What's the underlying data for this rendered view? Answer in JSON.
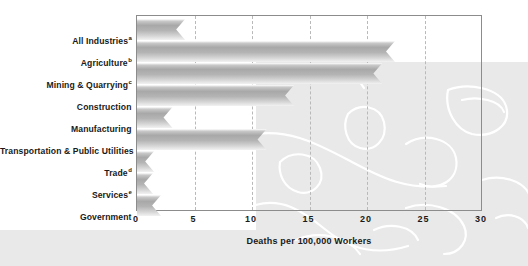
{
  "chart_data": {
    "type": "bar",
    "orientation": "horizontal",
    "title": "",
    "xlabel": "Deaths per 100,000 Workers",
    "ylabel": "",
    "xlim": [
      0,
      30
    ],
    "xticks": [
      "0",
      "5",
      "10",
      "15",
      "20",
      "25",
      "30"
    ],
    "xtick_values": [
      0,
      5,
      10,
      15,
      20,
      25,
      30
    ],
    "grid": "vertical-dashed",
    "legend": "none",
    "categories": [
      "All Industries",
      "Agriculture",
      "Mining & Quarrying",
      "Construction",
      "Manufacturing",
      "Transportation & Public Utilities",
      "Trade",
      "Services",
      "Government"
    ],
    "category_footnotes": [
      "a",
      "b",
      "c",
      "",
      "",
      "",
      "d",
      "e",
      ""
    ],
    "values": [
      4.2,
      22.5,
      21.4,
      13.7,
      3.1,
      11.3,
      1.5,
      1.4,
      2.1
    ],
    "bars": [
      {
        "label": "All Industries",
        "footnote": "a",
        "value": 4.2
      },
      {
        "label": "Agriculture",
        "footnote": "b",
        "value": 22.5
      },
      {
        "label": "Mining & Quarrying",
        "footnote": "c",
        "value": 21.4
      },
      {
        "label": "Construction",
        "footnote": "",
        "value": 13.7
      },
      {
        "label": "Manufacturing",
        "footnote": "",
        "value": 3.1
      },
      {
        "label": "Transportation & Public Utilities",
        "footnote": "",
        "value": 11.3
      },
      {
        "label": "Trade",
        "footnote": "d",
        "value": 1.5
      },
      {
        "label": "Services",
        "footnote": "e",
        "value": 1.4
      },
      {
        "label": "Government",
        "footnote": "",
        "value": 2.1
      }
    ]
  },
  "colors": {
    "bar_light": "#d2d2d2",
    "bar_mid": "#a8a8a8",
    "axis": "#8c8c8c",
    "gridline": "#b9b9b9",
    "text": "#1a1a1a",
    "watermark_panel": "#e9e9e9",
    "background": "#ffffff"
  }
}
